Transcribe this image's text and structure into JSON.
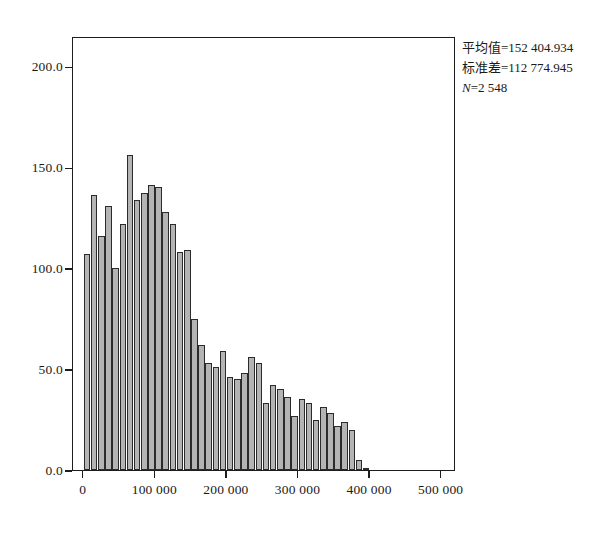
{
  "figure": {
    "type": "histogram",
    "background_color": "#ffffff",
    "bar_fill_color": "#b4b4b4",
    "bar_edge_color": "#2b2b2b",
    "axis_color": "#1d1d1d"
  },
  "annotations": {
    "mean_label": "平均值=152 404.934",
    "stddev_label": "标准差=112 774.945",
    "n_symbol": "N",
    "n_label": "=2 548"
  },
  "chart_data": {
    "type": "bar",
    "title": "",
    "xlabel": "",
    "ylabel": "",
    "grid": false,
    "legend": null,
    "xlim": [
      -15000,
      520000
    ],
    "ylim": [
      0,
      215
    ],
    "bin_width": 10000,
    "xticks": [
      0,
      100000,
      200000,
      300000,
      400000,
      500000
    ],
    "xtick_labels": [
      "0",
      "100 000",
      "200 000",
      "300 000",
      "400 000",
      "500 000"
    ],
    "yticks": [
      0,
      50,
      100,
      150,
      200
    ],
    "ytick_labels": [
      "0.0",
      "50.0",
      "100.0",
      "150.0",
      "200.0"
    ],
    "bin_starts": [
      0,
      10000,
      20000,
      30000,
      40000,
      50000,
      60000,
      70000,
      80000,
      90000,
      100000,
      110000,
      120000,
      130000,
      140000,
      150000,
      160000,
      170000,
      180000,
      190000,
      200000,
      210000,
      220000,
      230000,
      240000,
      250000,
      260000,
      270000,
      280000,
      290000,
      300000,
      310000,
      320000,
      330000,
      340000,
      350000,
      360000,
      370000,
      380000,
      390000,
      400000,
      410000,
      420000,
      430000,
      440000,
      450000,
      460000,
      470000,
      480000,
      490000
    ],
    "values": [
      107,
      136,
      116,
      131,
      100,
      122,
      156,
      134,
      137,
      141,
      140,
      128,
      122,
      108,
      109,
      75,
      62,
      53,
      51,
      59,
      46,
      45,
      48,
      56,
      53,
      33,
      42,
      40,
      36,
      27,
      35,
      33,
      25,
      31,
      28,
      22,
      24,
      20,
      5,
      1
    ],
    "annotations": {
      "mean": 152404.934,
      "stddev": 112774.945,
      "n": 2548
    }
  }
}
